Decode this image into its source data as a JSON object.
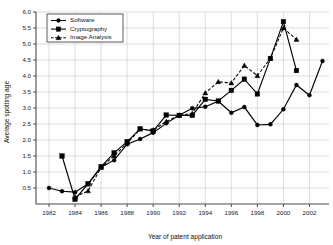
{
  "chart_data": {
    "type": "line",
    "title": "",
    "subtitle": "",
    "xlabel": "Year of patent application",
    "ylabel": "Average spotting age",
    "xlim": [
      1981,
      2003.5
    ],
    "ylim": [
      0.0,
      6.0
    ],
    "grid": true,
    "legend_position": "upper-left",
    "x_ticks": [
      "1982",
      "1984",
      "1986",
      "1988",
      "1990",
      "1992",
      "1994",
      "1996",
      "1998",
      "2000",
      "2002"
    ],
    "x_tick_values": [
      1982,
      1984,
      1986,
      1988,
      1990,
      1992,
      1994,
      1996,
      1998,
      2000,
      2002
    ],
    "y_ticks": [
      "0.5",
      "1.0",
      "1.5",
      "2.0",
      "2.5",
      "3.0",
      "3.5",
      "4.0",
      "4.5",
      "5.0",
      "5.5",
      "6.0"
    ],
    "y_tick_values": [
      0.5,
      1.0,
      1.5,
      2.0,
      2.5,
      3.0,
      3.5,
      4.0,
      4.5,
      5.0,
      5.5,
      6.0
    ],
    "series": [
      {
        "name": "Software",
        "marker": "circle",
        "linestyle": "solid",
        "color": "#000000",
        "x": [
          1982,
          1983,
          1984,
          1985,
          1986,
          1987,
          1988,
          1989,
          1990,
          1991,
          1992,
          1993,
          1994,
          1995,
          1996,
          1997,
          1998,
          1999,
          2000,
          2001,
          2002,
          2003
        ],
        "values": [
          0.5,
          0.4,
          0.37,
          0.63,
          1.15,
          1.37,
          1.87,
          2.03,
          2.23,
          2.52,
          2.77,
          2.99,
          3.04,
          3.21,
          2.85,
          3.03,
          2.47,
          2.49,
          2.96,
          3.72,
          3.4,
          4.47
        ]
      },
      {
        "name": "Cryptography",
        "marker": "square",
        "linestyle": "solid",
        "color": "#000000",
        "x": [
          1983,
          1984,
          1985,
          1986,
          1987,
          1988,
          1989,
          1990,
          1991,
          1992,
          1993,
          1994,
          1995,
          1996,
          1997,
          1998,
          1999,
          2000,
          2001
        ],
        "values": [
          1.5,
          0.15,
          0.63,
          1.17,
          1.6,
          1.95,
          2.35,
          2.28,
          2.78,
          2.77,
          2.77,
          3.27,
          3.22,
          3.55,
          3.9,
          3.44,
          4.55,
          5.7,
          4.17
        ]
      },
      {
        "name": "Image Analysis",
        "marker": "triangle",
        "linestyle": "dashed",
        "color": "#000000",
        "x": [
          1984,
          1985,
          1986,
          1987,
          1988,
          1989,
          1990,
          1991,
          1992,
          1993,
          1994,
          1995,
          1996,
          1997,
          1998,
          1999,
          2000,
          2001
        ],
        "values": [
          0.22,
          0.41,
          1.14,
          1.51,
          1.9,
          2.34,
          2.31,
          2.58,
          2.77,
          2.83,
          3.47,
          3.82,
          3.78,
          4.33,
          4.01,
          4.55,
          5.5,
          5.14
        ]
      }
    ]
  }
}
